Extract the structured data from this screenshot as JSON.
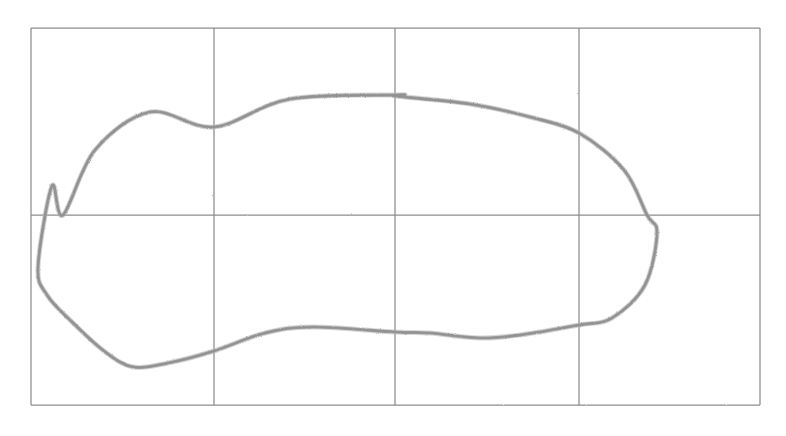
{
  "figure": {
    "background_color": "#ffffff",
    "grid": {
      "line_color": "#8c8c8c",
      "line_width_px": 1.25,
      "style": "hand-drawn",
      "frame": {
        "left": 31,
        "top": 28,
        "right": 760,
        "bottom": 405
      },
      "columns": 4,
      "rows": 2,
      "vertical_line_x": [
        31,
        214,
        395,
        579,
        760
      ],
      "horizontal_line_y": [
        28,
        215,
        405
      ]
    },
    "curve": {
      "name": "closed-blob-curve",
      "stroke_color": "#9e9e9e",
      "stroke_width_px": 3.1,
      "closed": true,
      "style": "pencil-sketch",
      "key_points": {
        "leftmost": [
          38,
          267
        ],
        "topmost": [
          400,
          95
        ],
        "rightmost": [
          657,
          233
        ],
        "bottom_left_dip": [
          133,
          367
        ],
        "bottom_saddle_peak": [
          313,
          327
        ],
        "bottom_right_low": [
          480,
          338
        ]
      },
      "grid_crossings": [
        {
          "at": "x=214 upper",
          "point": [
            214,
            127
          ]
        },
        {
          "at": "x=395 upper",
          "point": [
            395,
            96
          ]
        },
        {
          "at": "x=579 upper",
          "point": [
            579,
            133
          ]
        },
        {
          "at": "y=215 left",
          "point": [
            63,
            215
          ]
        },
        {
          "at": "y=215 right",
          "point": [
            647,
            215
          ]
        },
        {
          "at": "x=579 lower",
          "point": [
            579,
            325
          ]
        },
        {
          "at": "x=395 lower",
          "point": [
            395,
            332
          ]
        },
        {
          "at": "x=214 lower",
          "point": [
            214,
            351
          ]
        }
      ],
      "path_d": "M 38.5 267 C 39.5 232 47 200 63 176 C 84 144 118 118 155 101 C 200 80 256 71 310 72 C 370 73 432 86 490 110 C 545 133 596 165 627 202 C 652 232 662 266 657 298 C 651 334 626 361 592 378 C 560 394 521 399 480 396 C 440 393 404 381 372 368 C 336 354 304 340 272 338 C 238 336 207 346 180 362 C 158 375 142 385 133 381 C 124 377 119 365 111 349 C 100 327 85 306 70 285 C 52 260 39 243 38.5 267 Z"
    }
  }
}
